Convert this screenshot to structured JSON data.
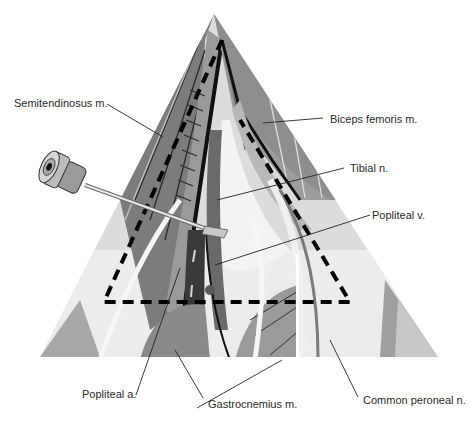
{
  "figure": {
    "colors": {
      "background": "#ffffff",
      "muscle_dark": "#6e6e6e",
      "muscle_mid": "#8f8f8f",
      "muscle_light": "#b4b4b4",
      "pale": "#e6e6e6",
      "vessel_dark": "#3a3a3a",
      "outline": "#111111",
      "dashed_triangle": "#000000",
      "label_text": "#2a2a2a"
    }
  },
  "labels": [
    {
      "id": "semitendinosus",
      "text": "Semitendinosus m."
    },
    {
      "id": "biceps-femoris",
      "text": "Biceps femoris m."
    },
    {
      "id": "tibial-nerve",
      "text": "Tibial n."
    },
    {
      "id": "popliteal-vein",
      "text": "Popliteal v."
    },
    {
      "id": "popliteal-artery",
      "text": "Popliteal a."
    },
    {
      "id": "gastrocnemius",
      "text": "Gastrocnemius m."
    },
    {
      "id": "common-peroneal",
      "text": "Common peroneal n."
    }
  ]
}
